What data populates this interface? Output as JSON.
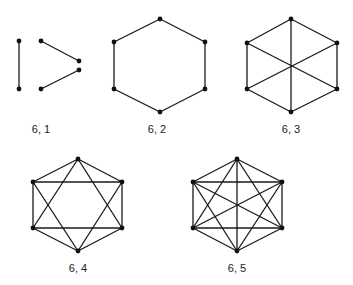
{
  "figure": {
    "colors": {
      "edge": "#1a1a1a",
      "node": "#111111",
      "label": "#222222",
      "background": "#ffffff"
    },
    "graphs": [
      {
        "id": "g61",
        "label": "6, 1",
        "label_pos": [
          41,
          123
        ],
        "nodes": [
          [
            19,
            41
          ],
          [
            19,
            89
          ],
          [
            41,
            41
          ],
          [
            79,
            61
          ],
          [
            79,
            70
          ],
          [
            41,
            89
          ]
        ],
        "edges": [
          [
            0,
            1
          ],
          [
            2,
            3
          ],
          [
            5,
            4
          ]
        ]
      },
      {
        "id": "g62",
        "label": "6, 2",
        "label_pos": [
          157,
          123
        ],
        "nodes": [
          [
            160,
            19
          ],
          [
            205,
            42
          ],
          [
            205,
            89
          ],
          [
            160,
            112
          ],
          [
            114,
            89
          ],
          [
            114,
            42
          ]
        ],
        "edges": [
          [
            0,
            1
          ],
          [
            1,
            2
          ],
          [
            2,
            3
          ],
          [
            3,
            4
          ],
          [
            4,
            5
          ],
          [
            5,
            0
          ]
        ]
      },
      {
        "id": "g63",
        "label": "6, 3",
        "label_pos": [
          291,
          123
        ],
        "nodes": [
          [
            291,
            19
          ],
          [
            337,
            43
          ],
          [
            337,
            89
          ],
          [
            291,
            112
          ],
          [
            247,
            89
          ],
          [
            247,
            43
          ]
        ],
        "edges": [
          [
            0,
            1
          ],
          [
            1,
            2
          ],
          [
            2,
            3
          ],
          [
            3,
            4
          ],
          [
            4,
            5
          ],
          [
            5,
            0
          ],
          [
            0,
            3
          ],
          [
            1,
            4
          ],
          [
            2,
            5
          ]
        ]
      },
      {
        "id": "g64",
        "label": "6, 4",
        "label_pos": [
          78,
          262
        ],
        "nodes": [
          [
            78,
            159
          ],
          [
            122,
            182
          ],
          [
            122,
            228
          ],
          [
            78,
            251
          ],
          [
            33,
            228
          ],
          [
            33,
            182
          ]
        ],
        "edges": [
          [
            0,
            1
          ],
          [
            1,
            2
          ],
          [
            2,
            3
          ],
          [
            3,
            4
          ],
          [
            4,
            5
          ],
          [
            5,
            0
          ],
          [
            5,
            1
          ],
          [
            4,
            2
          ],
          [
            0,
            2
          ],
          [
            0,
            4
          ],
          [
            3,
            5
          ],
          [
            3,
            1
          ]
        ]
      },
      {
        "id": "g65",
        "label": "6, 5",
        "label_pos": [
          237,
          262
        ],
        "nodes": [
          [
            237,
            159
          ],
          [
            282,
            182
          ],
          [
            282,
            228
          ],
          [
            237,
            251
          ],
          [
            193,
            228
          ],
          [
            193,
            182
          ]
        ],
        "edges": [
          [
            0,
            1
          ],
          [
            0,
            2
          ],
          [
            0,
            3
          ],
          [
            0,
            4
          ],
          [
            0,
            5
          ],
          [
            1,
            2
          ],
          [
            1,
            3
          ],
          [
            1,
            4
          ],
          [
            1,
            5
          ],
          [
            2,
            3
          ],
          [
            2,
            4
          ],
          [
            2,
            5
          ],
          [
            3,
            4
          ],
          [
            3,
            5
          ],
          [
            4,
            5
          ]
        ]
      }
    ]
  }
}
